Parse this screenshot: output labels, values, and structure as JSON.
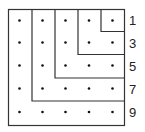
{
  "diagram": {
    "grid_size": 5,
    "line_color": "#333333",
    "dot_color": "#111111",
    "labels": [
      "1",
      "3",
      "5",
      "7",
      "9"
    ]
  }
}
